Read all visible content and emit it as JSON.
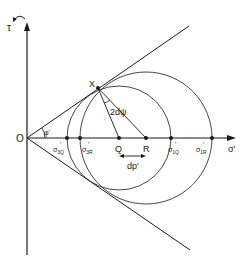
{
  "diagram": {
    "axes": {
      "y_label": "τ",
      "x_label": "σ'",
      "origin_label": "O"
    },
    "angle_label": "φ'",
    "point_labels": {
      "X": "X",
      "Q": "Q",
      "R": "R"
    },
    "stress_labels": {
      "s3Q": "σ'3Q",
      "s3R": "σ'3R",
      "s1Q": "σ'1Q",
      "s1R": "σ'1R"
    },
    "stress_parts": {
      "sigma": "σ",
      "prime": "'",
      "s3Q_sub": "3Q",
      "s3R_sub": "3R",
      "s1Q_sub": "1Q",
      "s1R_sub": "1R"
    },
    "angle_increment_label": "2dψ",
    "dp_label": "dp'",
    "colors": {
      "line": "#1a1a1a",
      "circle": "#333333",
      "background": "#ffffff"
    }
  }
}
